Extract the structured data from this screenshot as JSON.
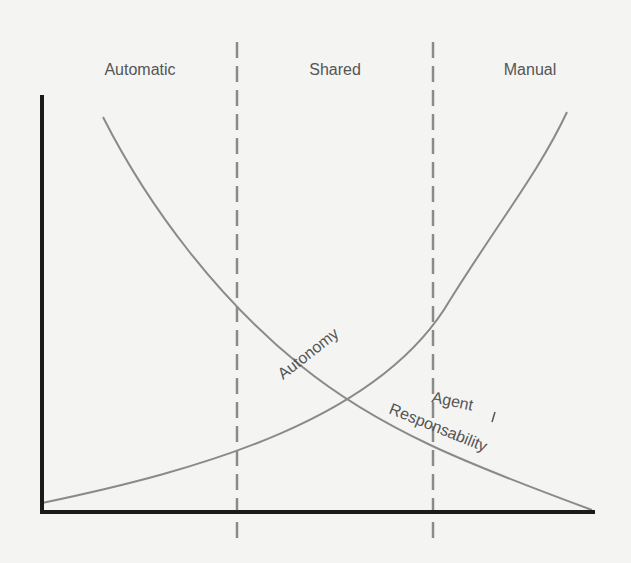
{
  "diagram": {
    "zones": [
      {
        "label": "Automatic",
        "center_x": 140
      },
      {
        "label": "Shared",
        "center_x": 335
      },
      {
        "label": "Manual",
        "center_x": 530
      }
    ],
    "dividers_x": [
      237,
      433
    ],
    "curves": {
      "autonomy": {
        "label": "Autonomy",
        "direction": "increasing from Automatic to Manual"
      },
      "responsibility": {
        "label_line1": "Agent",
        "label_line2": "Responsability",
        "direction": "decreasing from Automatic to Manual"
      }
    },
    "colors": {
      "background": "#f4f4f2",
      "axis": "#1a1a1a",
      "curve": "#8a8a8a",
      "divider": "#8a8a8a",
      "text": "#555555"
    }
  }
}
